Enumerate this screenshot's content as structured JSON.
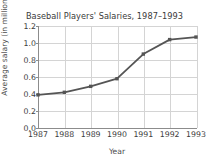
{
  "chart_data": {
    "type": "line",
    "title": "Baseball Players' Salaries, 1987–1993",
    "xlabel": "Year",
    "ylabel": "Average salary (in millions)",
    "categories": [
      "1987",
      "1988",
      "1989",
      "1990",
      "1991",
      "1992",
      "1993"
    ],
    "x": [
      1987,
      1988,
      1989,
      1990,
      1991,
      1992,
      1993
    ],
    "values": [
      0.39,
      0.42,
      0.49,
      0.58,
      0.87,
      1.04,
      1.07
    ],
    "series": [
      {
        "name": "Average salary",
        "values": [
          0.39,
          0.42,
          0.49,
          0.58,
          0.87,
          1.04,
          1.07
        ]
      }
    ],
    "ylim": [
      0.0,
      1.2
    ],
    "xlim": [
      1987,
      1993
    ],
    "yticks": [
      "0.0",
      "0.2",
      "0.4",
      "0.6",
      "0.8",
      "1.0",
      "1.2"
    ],
    "ytick_values": [
      0.0,
      0.2,
      0.4,
      0.6,
      0.8,
      1.0,
      1.2
    ],
    "xticks": [
      "1987",
      "1988",
      "1989",
      "1990",
      "1991",
      "1992",
      "1993"
    ],
    "grid": true,
    "legend": false,
    "legend_position": "none",
    "line_color": "#555555",
    "marker": "square",
    "grid_color": "#d4d4d4",
    "axis_color": "#8c8c8c",
    "background": "#ffffff"
  }
}
